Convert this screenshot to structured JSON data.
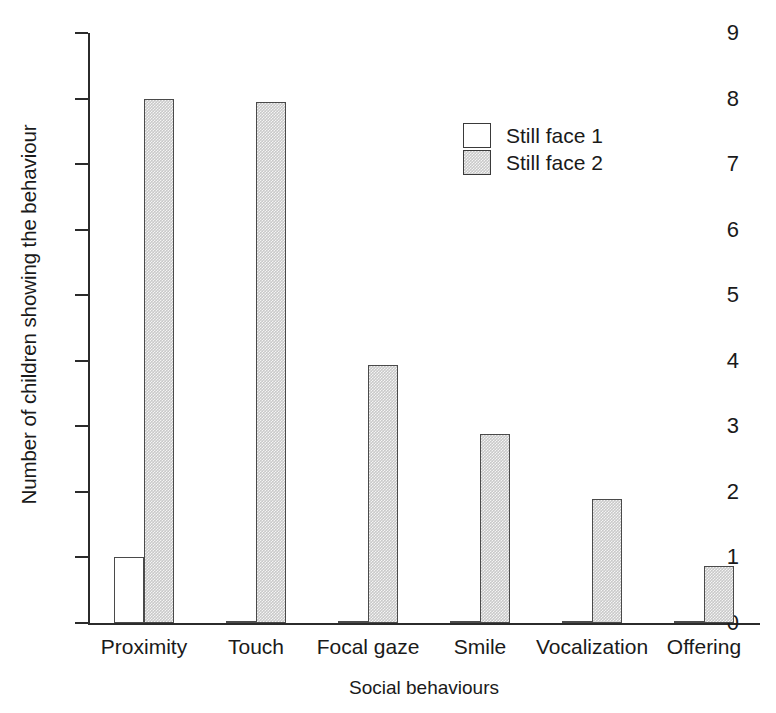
{
  "chart_data": {
    "type": "bar",
    "title": "",
    "xlabel": "Social behaviours",
    "ylabel": "Number of children showing the behaviour",
    "categories": [
      "Proximity",
      "Touch",
      "Focal gaze",
      "Smile",
      "Vocalization",
      "Offering"
    ],
    "series": [
      {
        "name": "Still face 1",
        "color": "#ffffff",
        "values": [
          1,
          0,
          0,
          0,
          0,
          0
        ]
      },
      {
        "name": "Still face 2",
        "color": "#c9c9c9",
        "values": [
          8,
          7.95,
          3.93,
          2.88,
          1.89,
          0.87
        ]
      }
    ],
    "ylim": [
      0,
      9
    ],
    "yticks": [
      0,
      1,
      2,
      3,
      4,
      5,
      6,
      7,
      8,
      9
    ],
    "ytick_labels": [
      "0",
      "1",
      "2",
      "3",
      "4",
      "5",
      "6",
      "7",
      "8",
      "9"
    ],
    "grid": false,
    "legend_position": "upper right"
  },
  "legend": {
    "entries": [
      {
        "label": "Still face 1"
      },
      {
        "label": "Still face 2"
      }
    ]
  }
}
